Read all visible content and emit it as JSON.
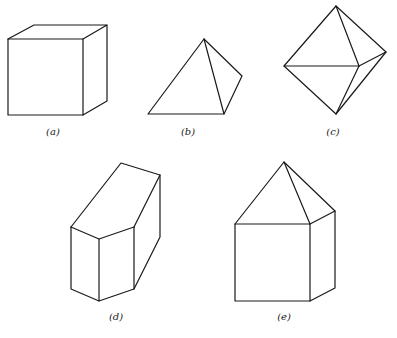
{
  "figures": [
    {
      "id": "a",
      "label": "(a)",
      "shape": "cube"
    },
    {
      "id": "b",
      "label": "(b)",
      "shape": "tetrahedron"
    },
    {
      "id": "c",
      "label": "(c)",
      "shape": "octahedron"
    },
    {
      "id": "d",
      "label": "(d)",
      "shape": "truncated prism"
    },
    {
      "id": "e",
      "label": "(e)",
      "shape": "cube with pyramid roof"
    }
  ]
}
